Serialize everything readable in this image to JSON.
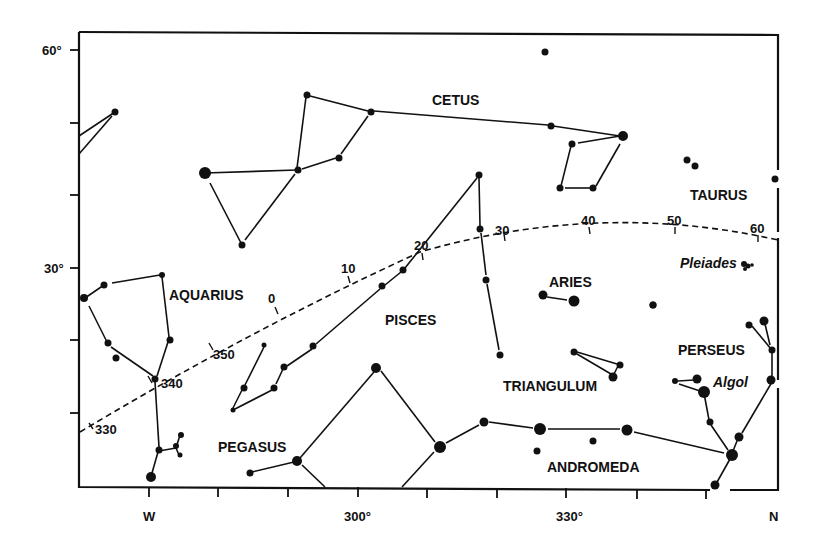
{
  "map": {
    "title": "",
    "y_axis": {
      "labels": [
        {
          "text": "60°",
          "y": 50
        },
        {
          "text": "30°",
          "y": 268
        }
      ]
    },
    "x_axis": {
      "labels": [
        {
          "text": "W",
          "x": 149
        },
        {
          "text": "300°",
          "x": 357
        },
        {
          "text": "330°",
          "x": 570
        },
        {
          "text": "N",
          "x": 776
        }
      ]
    },
    "constellations": [
      {
        "name": "CETUS"
      },
      {
        "name": "TAURUS"
      },
      {
        "name": "AQUARIUS"
      },
      {
        "name": "PISCES"
      },
      {
        "name": "ARIES"
      },
      {
        "name": "PERSEUS"
      },
      {
        "name": "TRIANGULUM"
      },
      {
        "name": "PEGASUS"
      },
      {
        "name": "ANDROMEDA"
      }
    ],
    "objects": [
      {
        "name": "Pleiades"
      },
      {
        "name": "Algol"
      }
    ],
    "ecliptic": {
      "style": "dashed",
      "marks": [
        "330",
        "340",
        "350",
        "0",
        "10",
        "20",
        "30",
        "40",
        "50",
        "60"
      ]
    },
    "colors": {
      "ink": "#111111",
      "paper": "#ffffff"
    }
  }
}
